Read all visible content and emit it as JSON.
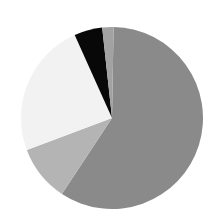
{
  "chart_data": {
    "type": "pie",
    "title": "",
    "legend": [],
    "start_angle_deg": 1,
    "direction": "clockwise",
    "slices": [
      {
        "label": "",
        "value": 59,
        "color": "#8a8a8a"
      },
      {
        "label": "",
        "value": 10,
        "color": "#b4b4b4"
      },
      {
        "label": "",
        "value": 24,
        "color": "#f2f2f2"
      },
      {
        "label": "",
        "value": 5,
        "color": "#080808"
      },
      {
        "label": "",
        "value": 2,
        "color": "#a2a2a2"
      }
    ],
    "center": [
      112,
      118
    ],
    "radius": 91
  }
}
